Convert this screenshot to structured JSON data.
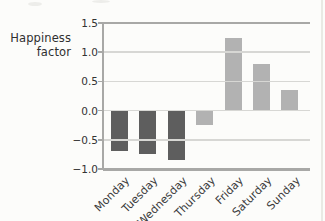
{
  "chart_data": {
    "type": "bar",
    "title": "",
    "ylabel": "Happiness factor",
    "ylabel_lines": [
      "Happiness",
      "factor"
    ],
    "xlabel": "",
    "categories": [
      "Monday",
      "Tuesday",
      "Wednesday",
      "Thursday",
      "Friday",
      "Saturday",
      "Sunday"
    ],
    "values": [
      -0.7,
      -0.75,
      -0.85,
      -0.25,
      1.25,
      0.8,
      0.35
    ],
    "bar_colors": [
      "#5e5e5e",
      "#5e5e5e",
      "#5e5e5e",
      "#b2b2b2",
      "#b2b2b2",
      "#b2b2b2",
      "#b2b2b2"
    ],
    "ylim": [
      -1.0,
      1.5
    ],
    "ytick_step": 0.5,
    "ytick_labels": [
      "1.5",
      "1.0",
      "0.5",
      "0.0",
      "−0.5",
      "−1.0"
    ],
    "grid": true,
    "gridlines_on_top_of_bars": true,
    "legend_position": "none"
  },
  "colors": {
    "dark_bar": "#5e5e5e",
    "light_bar": "#b2b2b2",
    "axis": "#a8a8a6",
    "gridline": "#d7d7d4",
    "text": "#333333",
    "background": "#fcfcfa"
  }
}
